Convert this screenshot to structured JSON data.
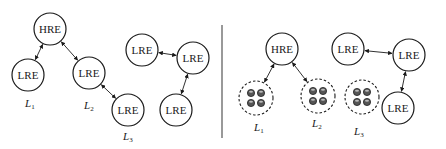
{
  "diagram": {
    "colors": {
      "stroke": "#1a1a1a",
      "background": "#ffffff",
      "sensor_fill": "#555555"
    },
    "left_panel": {
      "nodes": [
        {
          "id": "hre",
          "label": "HRE",
          "x": 50,
          "y": 29
        },
        {
          "id": "lre1",
          "label": "LRE",
          "x": 28,
          "y": 75
        },
        {
          "id": "lre2",
          "label": "LRE",
          "x": 89,
          "y": 73
        },
        {
          "id": "lre3",
          "label": "LRE",
          "x": 128,
          "y": 110
        },
        {
          "id": "lre4",
          "label": "LRE",
          "x": 142,
          "y": 50
        },
        {
          "id": "lre5",
          "label": "LRE",
          "x": 193,
          "y": 58
        },
        {
          "id": "lre6",
          "label": "LRE",
          "x": 176,
          "y": 110
        }
      ],
      "edges": [
        [
          "hre",
          "lre1"
        ],
        [
          "hre",
          "lre2"
        ],
        [
          "lre2",
          "lre3"
        ],
        [
          "lre4",
          "lre5"
        ],
        [
          "lre5",
          "lre6"
        ]
      ],
      "level_labels": [
        {
          "letter": "L",
          "sub": "1",
          "x": 25,
          "y": 107
        },
        {
          "letter": "L",
          "sub": "2",
          "x": 84,
          "y": 109
        },
        {
          "letter": "L",
          "sub": "3",
          "x": 123,
          "y": 140
        }
      ]
    },
    "right_panel": {
      "nodes": [
        {
          "id": "hre",
          "label": "HRE",
          "x": 282,
          "y": 49
        },
        {
          "id": "lre1",
          "label": "LRE",
          "x": 348,
          "y": 49
        },
        {
          "id": "lre2",
          "label": "LRE",
          "x": 409,
          "y": 55
        },
        {
          "id": "lre3",
          "label": "LRE",
          "x": 398,
          "y": 108
        }
      ],
      "clusters": [
        {
          "id": "c1",
          "x": 256,
          "y": 98
        },
        {
          "id": "c2",
          "x": 318,
          "y": 96
        },
        {
          "id": "c3",
          "x": 362,
          "y": 97
        }
      ],
      "edges": [
        [
          "hre",
          "c1"
        ],
        [
          "hre",
          "c2"
        ],
        [
          "lre1",
          "lre2"
        ],
        [
          "lre2",
          "lre3"
        ]
      ],
      "level_labels": [
        {
          "letter": "L",
          "sub": "1",
          "x": 254,
          "y": 131
        },
        {
          "letter": "L",
          "sub": "2",
          "x": 312,
          "y": 127
        },
        {
          "letter": "L",
          "sub": "3",
          "x": 354,
          "y": 135
        }
      ]
    }
  }
}
